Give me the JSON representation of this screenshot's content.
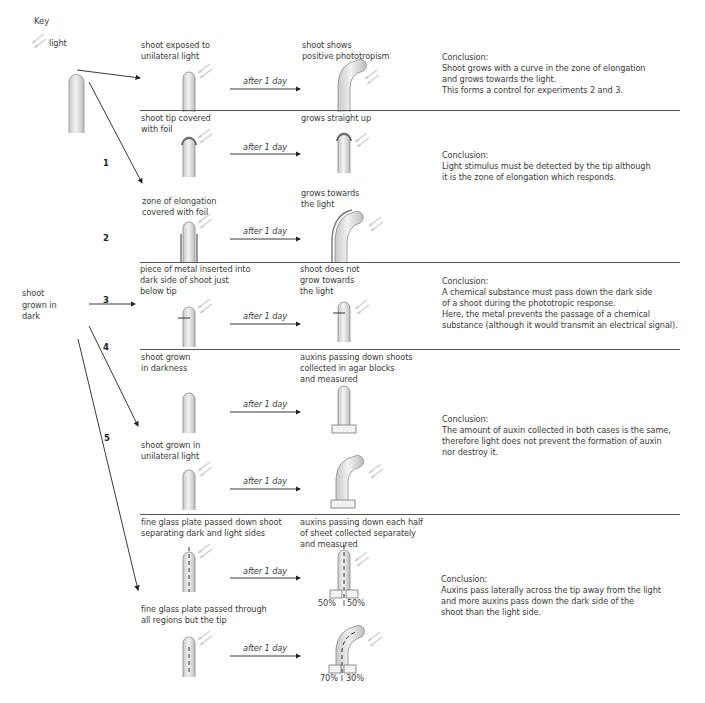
{
  "key": {
    "title": "Key",
    "light_label": "light"
  },
  "origin": {
    "label": "shoot\ngrown in\ndark"
  },
  "branches": [
    {
      "number": "1"
    },
    {
      "number": "2"
    },
    {
      "number": "3"
    },
    {
      "number": "4"
    },
    {
      "number": "5"
    }
  ],
  "arrow_label": "after 1 day",
  "experiments": [
    {
      "id": 1,
      "rows": [
        {
          "before": "shoot exposed to\nunilateral light",
          "after": "shoot shows\npositive phototropism"
        }
      ],
      "conclusion_title": "Conclusion:",
      "conclusion": "Shoot grows with a curve in the zone of elongation\nand grows towards the light.\nThis forms a control for experiments 2 and 3."
    },
    {
      "id": 2,
      "rows": [
        {
          "before": "shoot tip covered\nwith foil",
          "after": "grows straight up"
        },
        {
          "before": "zone of elongation\ncovered with foil",
          "after": "grows towards\nthe light"
        }
      ],
      "conclusion_title": "Conclusion:",
      "conclusion": "Light stimulus must be detected by the tip although\nit is the zone of elongation which responds."
    },
    {
      "id": 3,
      "rows": [
        {
          "before": "piece of metal inserted into\ndark side of shoot just\nbelow tip",
          "after": "shoot does not\ngrow towards\nthe light"
        }
      ],
      "conclusion_title": "Conclusion:",
      "conclusion": "A chemical substance must pass down the dark side\nof a shoot during the phototropic response.\nHere, the metal prevents the passage of a chemical\nsubstance (although it would transmit an electrical signal)."
    },
    {
      "id": 4,
      "rows": [
        {
          "before": "shoot grown\nin darkness",
          "after": "auxins passing down shoots\ncollected in agar blocks\nand measured"
        },
        {
          "before": "shoot grown in\nunilateral light",
          "after": ""
        }
      ],
      "conclusion_title": "Conclusion:",
      "conclusion": "The amount of auxin collected in both cases is the same,\ntherefore light does not prevent the formation of auxin\nnor destroy it."
    },
    {
      "id": 5,
      "rows": [
        {
          "before": "fine glass plate passed down shoot\nseparating dark and light sides",
          "after": "auxins passing down each half\nof sheet collected separately\nand measured",
          "left_pct": "50%",
          "right_pct": "50%"
        },
        {
          "before": "fine glass plate passed through\nall regions but the tip",
          "after": "",
          "left_pct": "70%",
          "right_pct": "30%"
        }
      ],
      "conclusion_title": "Conclusion:",
      "conclusion": "Auxins pass laterally across the tip away from the light\nand more auxins pass down the dark side of the\nshoot than the light side."
    }
  ],
  "colors": {
    "shoot_fill": "#d9d9d9",
    "shoot_stroke": "#8a8a8a",
    "light_arrow": "#d0d0d0",
    "divider": "#555555",
    "text": "#3c3c3c"
  }
}
